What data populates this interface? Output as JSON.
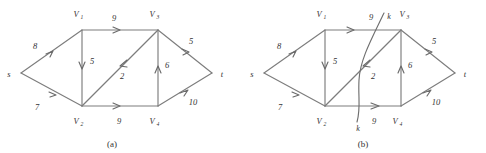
{
  "figure": {
    "stroke_color": "#7d7d7d",
    "text_color": "#333333",
    "background": "#ffffff"
  },
  "panels": [
    {
      "id": "a",
      "caption": "(a)",
      "nodes": {
        "s": "s",
        "t": "t",
        "v1_name": "V",
        "v1_sub": "1",
        "v2_name": "V",
        "v2_sub": "2",
        "v3_name": "V",
        "v3_sub": "3",
        "v4_name": "V",
        "v4_sub": "4"
      },
      "edges": [
        {
          "id": "s-v1",
          "from": "s",
          "to": "V1",
          "capacity": "8"
        },
        {
          "id": "s-v2",
          "from": "s",
          "to": "V2",
          "capacity": "7"
        },
        {
          "id": "v1-v3",
          "from": "V1",
          "to": "V3",
          "capacity": "9"
        },
        {
          "id": "v1-v2",
          "from": "V1",
          "to": "V2",
          "capacity": "5"
        },
        {
          "id": "v3-v2",
          "from": "V3",
          "to": "V2",
          "capacity": "2"
        },
        {
          "id": "v4-v3",
          "from": "V4",
          "to": "V3",
          "capacity": "6"
        },
        {
          "id": "v2-v4",
          "from": "V2",
          "to": "V4",
          "capacity": "9"
        },
        {
          "id": "v3-t",
          "from": "V3",
          "to": "t",
          "capacity": "5"
        },
        {
          "id": "v4-t",
          "from": "V4",
          "to": "t",
          "capacity": "10"
        }
      ]
    },
    {
      "id": "b",
      "caption": "(b)",
      "nodes": {
        "s": "s",
        "t": "t",
        "v1_name": "V",
        "v1_sub": "1",
        "v2_name": "V",
        "v2_sub": "2",
        "v3_name": "V",
        "v3_sub": "3",
        "v4_name": "V",
        "v4_sub": "4"
      },
      "edges": [
        {
          "id": "s-v1",
          "from": "s",
          "to": "V1",
          "capacity": "8"
        },
        {
          "id": "s-v2",
          "from": "s",
          "to": "V2",
          "capacity": "7"
        },
        {
          "id": "v1-v3",
          "from": "V1",
          "to": "V3",
          "capacity": "9"
        },
        {
          "id": "v1-v2",
          "from": "V1",
          "to": "V2",
          "capacity": "5"
        },
        {
          "id": "v3-v2",
          "from": "V3",
          "to": "V2",
          "capacity": "2"
        },
        {
          "id": "v4-v3",
          "from": "V4",
          "to": "V3",
          "capacity": "6"
        },
        {
          "id": "v2-v4",
          "from": "V2",
          "to": "V4",
          "capacity": "9"
        },
        {
          "id": "v3-t",
          "from": "V3",
          "to": "t",
          "capacity": "5"
        },
        {
          "id": "v4-t",
          "from": "V4",
          "to": "t",
          "capacity": "10"
        }
      ],
      "cut": {
        "label_top": "k",
        "label_bottom": "k"
      }
    }
  ]
}
